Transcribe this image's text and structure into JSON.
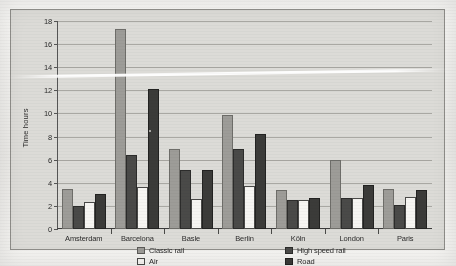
{
  "chart_data": {
    "type": "bar",
    "title": "",
    "xlabel": "",
    "ylabel": "Time hours",
    "ylim": [
      0,
      18
    ],
    "ytick_step": 2,
    "yticks": [
      0,
      2,
      4,
      6,
      8,
      10,
      12,
      14,
      16,
      18
    ],
    "grid": true,
    "legend_position": "bottom",
    "categories": [
      "Amsterdam",
      "Barcelona",
      "Basle",
      "Berlin",
      "Köln",
      "London",
      "Paris"
    ],
    "series": [
      {
        "name": "Classic rail",
        "key": "classic",
        "color": "#9d9c98",
        "values": [
          3.5,
          17.3,
          6.9,
          9.9,
          3.4,
          6.0,
          3.5
        ]
      },
      {
        "name": "High speed rail",
        "key": "highspeed",
        "color": "#4a4a48",
        "values": [
          2.0,
          6.4,
          5.1,
          6.9,
          2.5,
          2.7,
          2.1
        ]
      },
      {
        "name": "Air",
        "key": "air",
        "color": "#f8f7f4",
        "values": [
          2.3,
          3.6,
          2.6,
          3.7,
          2.5,
          2.7,
          2.8
        ]
      },
      {
        "name": "Road",
        "key": "road",
        "color": "#3b3b39",
        "values": [
          3.0,
          12.1,
          5.1,
          8.2,
          2.7,
          3.8,
          3.4
        ]
      }
    ]
  },
  "axis": {
    "y_title": "Time hours",
    "tick_labels": [
      "18",
      "16",
      "14",
      "12",
      "10",
      "8",
      "6",
      "4",
      "2",
      "0"
    ]
  },
  "legend": {
    "items": [
      {
        "label": "Classic rail",
        "key": "classic"
      },
      {
        "label": "High speed rail",
        "key": "highspeed"
      },
      {
        "label": "Air",
        "key": "air"
      },
      {
        "label": "Road",
        "key": "road"
      }
    ]
  },
  "colors": {
    "classic_rail": "#9d9c98",
    "high_speed_rail": "#4a4a48",
    "air": "#f8f7f4",
    "road": "#3b3b39",
    "plot_background": "#dcdbd7",
    "page_background": "#f3f2ef",
    "gridline": "#a9a8a3",
    "axis": "#3a3a3a"
  }
}
